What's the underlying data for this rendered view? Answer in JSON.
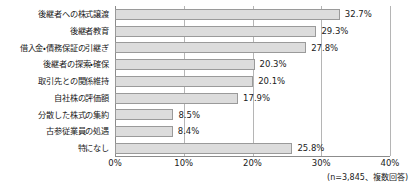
{
  "chart_data": {
    "type": "bar",
    "orientation": "horizontal",
    "title": "",
    "subtitle": "",
    "xlabel": "",
    "ylabel": "",
    "xlim": [
      0,
      40
    ],
    "xticks": [
      0,
      10,
      20,
      30,
      40
    ],
    "xtick_labels": [
      "0%",
      "10%",
      "20%",
      "30%",
      "40%"
    ],
    "grid": true,
    "grid_axis": "x",
    "legend": false,
    "legend_position": "none",
    "value_label_suffix": "%",
    "bar_color": "#dcdcdc",
    "bar_border_color": "#9a9a9a",
    "axis_color": "#8c8c8c",
    "grid_color": "#b5b5b5",
    "text_color": "#1a1a1a",
    "categories": [
      "後継者への株式譲渡",
      "後継者教育",
      "借入金・債務保証の引継ぎ",
      "後継者の探索・確保",
      "取引先との関係維持",
      "自社株の評価額",
      "分散した株式の集約",
      "古参従業員の処遇",
      "特になし"
    ],
    "values": [
      32.7,
      29.3,
      27.8,
      20.3,
      20.1,
      17.9,
      8.5,
      8.4,
      25.8
    ],
    "value_labels": [
      "32.7%",
      "29.3%",
      "27.8%",
      "20.3%",
      "20.1%",
      "17.9%",
      "8.5%",
      "8.4%",
      "25.8%"
    ],
    "annotations": [
      "(n=3,845、複数回答)"
    ]
  },
  "footnote": "(n=3,845、複数回答)"
}
